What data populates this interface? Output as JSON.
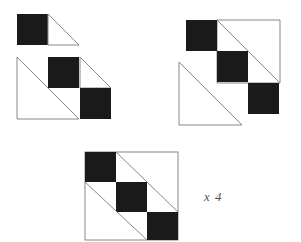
{
  "figure": {
    "background_color": "#ffffff",
    "dark_fill": "#1a1a1a",
    "light_fill": "#ffffff",
    "outline_color": "#888888",
    "outline_width": 1,
    "width": 301,
    "height": 242
  },
  "annotation": {
    "repeat_label": "x 4"
  },
  "unit": {
    "cell_size": 31,
    "description": "Each unit is a square cell: a solid dark square paired with a white right triangle"
  },
  "groups": [
    {
      "name": "exploded-units-group",
      "label": "Three separate half-square triangle units shown apart",
      "units": [
        {
          "name": "unit-a",
          "x": 17,
          "y": 14,
          "dark_square": {
            "x": 17,
            "y": 14,
            "w": 31,
            "h": 31
          },
          "triangle_points": "48,14 79,45 48,45",
          "triangle_fill": "#ffffff"
        },
        {
          "name": "unit-b",
          "x": 17,
          "y": 57,
          "dark_square": {
            "x": 48,
            "y": 57,
            "w": 31,
            "h": 31
          },
          "triangle_points": "17,57 79,119 17,119",
          "triangle_fill": "#ffffff"
        },
        {
          "name": "unit-c",
          "x": 80,
          "y": 57,
          "dark_square": {
            "x": 80,
            "y": 88,
            "w": 31,
            "h": 31
          },
          "triangle_points": "80,57 111,88 80,88",
          "triangle_fill": "#ffffff"
        }
      ]
    },
    {
      "name": "partial-assembly-group",
      "label": "Two chained triangle units joined diagonally",
      "units": [
        {
          "name": "upper-chain",
          "dark_square": {
            "x": 186,
            "y": 20,
            "w": 31,
            "h": 31
          },
          "triangle_points": "217,20 280,83 217,83",
          "triangle_fill": "#ffffff"
        },
        {
          "name": "upper-dark-2",
          "dark_square": {
            "x": 217,
            "y": 51,
            "w": 31,
            "h": 31
          }
        },
        {
          "name": "lower-chain",
          "triangle_points": "179,62 242,125 179,125",
          "triangle_fill": "#ffffff"
        },
        {
          "name": "lower-dark",
          "dark_square": {
            "x": 248,
            "y": 83,
            "w": 31,
            "h": 31
          }
        }
      ]
    },
    {
      "name": "finished-block-group",
      "label": "Completed 3x3 pieced block",
      "block": {
        "x": 85,
        "y": 152,
        "w": 93,
        "h": 88
      },
      "dark_squares": [
        {
          "name": "block-dark-top-left",
          "x": 85,
          "y": 152,
          "w": 31,
          "h": 30
        },
        {
          "name": "block-dark-center",
          "x": 116,
          "y": 182,
          "w": 31,
          "h": 30
        },
        {
          "name": "block-dark-bottom-right",
          "x": 147,
          "y": 212,
          "w": 31,
          "h": 28
        }
      ],
      "seam_lines": [
        {
          "name": "seam-upper-diagonal",
          "x1": 116,
          "y1": 152,
          "x2": 178,
          "y2": 212
        },
        {
          "name": "seam-lower-diagonal",
          "x1": 85,
          "y1": 182,
          "x2": 147,
          "y2": 240
        }
      ]
    }
  ]
}
